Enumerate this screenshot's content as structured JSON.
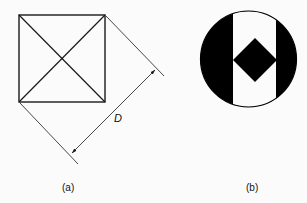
{
  "figure_a": {
    "caption": "(a)",
    "dimension_label": "D",
    "shape": "square with both diagonals",
    "stroke_color": "#1a1a1a"
  },
  "figure_b": {
    "caption": "(b)",
    "shape": "black circle with white vertical band and black diamond",
    "fill_color": "#000000",
    "band_color": "#ffffff"
  }
}
